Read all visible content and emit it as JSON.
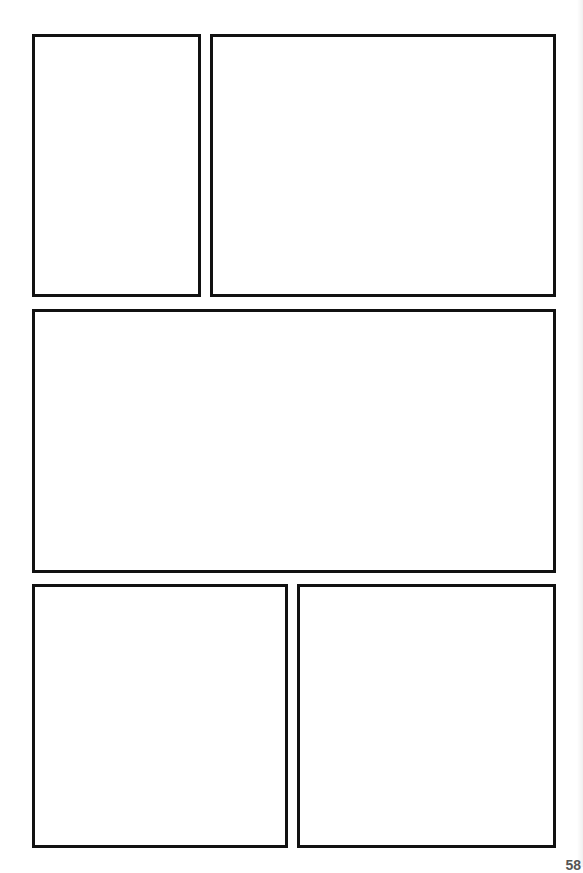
{
  "page": {
    "type": "comic-page-template",
    "background": "#ffffff",
    "border_color": "#111111",
    "page_number": "58"
  },
  "panels": [
    {
      "id": 1,
      "label": "",
      "x": 32,
      "y": 34,
      "w": 169,
      "h": 263
    },
    {
      "id": 2,
      "label": "",
      "x": 210,
      "y": 34,
      "w": 346,
      "h": 263
    },
    {
      "id": 3,
      "label": "",
      "x": 32,
      "y": 309,
      "w": 524,
      "h": 264
    },
    {
      "id": 4,
      "label": "",
      "x": 32,
      "y": 584,
      "w": 256,
      "h": 264
    },
    {
      "id": 5,
      "label": "",
      "x": 297,
      "y": 584,
      "w": 259,
      "h": 264
    }
  ]
}
